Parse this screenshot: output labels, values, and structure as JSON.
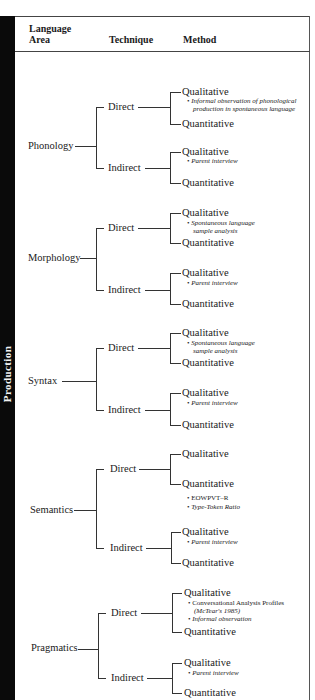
{
  "sidebar": {
    "label": "Production"
  },
  "header": {
    "col1_line1": "Language",
    "col1_line2": "Area",
    "col2": "Technique",
    "col3": "Method"
  },
  "areas": [
    {
      "name": "Phonology",
      "direct": {
        "label": "Direct",
        "qualitative": "Qualitative",
        "qualitative_notes": [
          "Informal observation of phonological",
          "production in spontaneous language"
        ],
        "quantitative": "Quantitative",
        "quantitative_notes": []
      },
      "indirect": {
        "label": "Indirect",
        "qualitative": "Qualitative",
        "qualitative_notes": [
          "Parent interview"
        ],
        "quantitative": "Quantitative"
      }
    },
    {
      "name": "Morphology",
      "direct": {
        "label": "Direct",
        "qualitative": "Qualitative",
        "qualitative_notes": [
          "Spontaneous language",
          "sample analysis"
        ],
        "quantitative": "Quantitative",
        "quantitative_notes": []
      },
      "indirect": {
        "label": "Indirect",
        "qualitative": "Qualitative",
        "qualitative_notes": [
          "Parent interview"
        ],
        "quantitative": "Quantitative"
      }
    },
    {
      "name": "Syntax",
      "direct": {
        "label": "Direct",
        "qualitative": "Qualitative",
        "qualitative_notes": [
          "Spontaneous language",
          "sample analysis"
        ],
        "quantitative": "Quantitative",
        "quantitative_notes": []
      },
      "indirect": {
        "label": "Indirect",
        "qualitative": "Qualitative",
        "qualitative_notes": [
          "Parent interview"
        ],
        "quantitative": "Quantitative"
      }
    },
    {
      "name": "Semantics",
      "direct": {
        "label": "Direct",
        "qualitative": "Qualitative",
        "qualitative_notes": [],
        "quantitative": "Quantitative",
        "quantitative_notes": [
          "EOWPVT–R",
          "Type-Token Ratio"
        ]
      },
      "indirect": {
        "label": "Indirect",
        "qualitative": "Qualitative",
        "qualitative_notes": [
          "Parent interview"
        ],
        "quantitative": "Quantitative"
      }
    },
    {
      "name": "Pragmatics",
      "direct": {
        "label": "Direct",
        "qualitative": "Qualitative",
        "qualitative_notes": [
          "Conversational Analysis Profiles",
          "(McTear's 1985)",
          "Informal observation"
        ],
        "quantitative": "Quantitative",
        "quantitative_notes": []
      },
      "indirect": {
        "label": "Indirect",
        "qualitative": "Qualitative",
        "qualitative_notes": [
          "Parent interview"
        ],
        "quantitative": "Quantitative"
      }
    }
  ],
  "bullet": "•"
}
